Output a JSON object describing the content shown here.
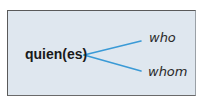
{
  "diagram": {
    "source": "quien(es)",
    "targets": [
      {
        "label": "who"
      },
      {
        "label": "whom"
      }
    ],
    "colors": {
      "background": "#dfe7ef",
      "border": "#5a5a5a",
      "connector": "#3a9ad6",
      "text": "#1a1a1a"
    }
  }
}
